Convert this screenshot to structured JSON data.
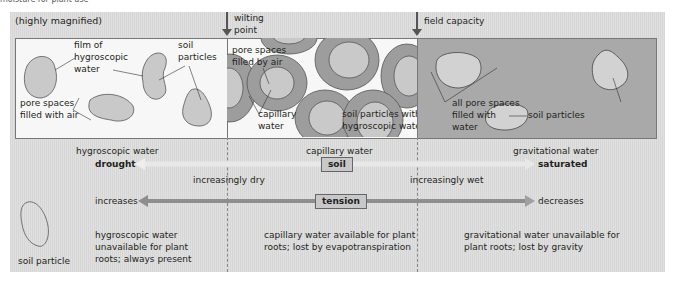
{
  "figure": {
    "caption_partial": "moisture for plant use",
    "magnification_note": "(highly magnified)"
  },
  "markers": [
    {
      "id": "wilting-point",
      "label_line1": "wilting",
      "label_line2": "point"
    },
    {
      "id": "field-capacity",
      "label": "field capacity"
    }
  ],
  "panels": {
    "hygroscopic": {
      "labels": {
        "film": [
          "film of",
          "hygroscopic",
          "water"
        ],
        "soil_particles": [
          "soil",
          "particles"
        ],
        "pore_spaces": [
          "pore spaces",
          "filled with air"
        ]
      }
    },
    "capillary": {
      "labels": {
        "pore_spaces": [
          "pore spaces",
          "filled by air"
        ],
        "capillary_water": [
          "capillary",
          "water"
        ],
        "soil_particles": [
          "soil particles with",
          "hygroscopic water"
        ]
      }
    },
    "gravitational": {
      "labels": {
        "pore_spaces": [
          "all pore  spaces",
          "filled with",
          "water"
        ],
        "soil_particles": "soil particles"
      }
    }
  },
  "scale": {
    "water_types": [
      "hygroscopic water",
      "capillary water",
      "gravitational water"
    ],
    "soil_axis": {
      "label": "soil",
      "left": "drought",
      "right": "saturated",
      "left_trend": "increasingly dry",
      "right_trend": "increasingly wet"
    },
    "tension_axis": {
      "label": "tension",
      "left": "increases",
      "right": "decreases"
    }
  },
  "descriptions": {
    "hygroscopic": [
      "hygroscopic water",
      "unavailable for plant",
      "roots; always present"
    ],
    "capillary": [
      "capillary water available for plant",
      "roots; lost by evapotranspiration"
    ],
    "gravitational": [
      "gravitational water unavailable for",
      "plant roots; lost by gravity"
    ]
  },
  "legend": {
    "soil_particle": "soil particle"
  },
  "colors": {
    "background": "#dcdcdc",
    "white_panel": "#f7f7f7",
    "saturated_panel": "#a9a9a9",
    "particle_fill": "#c9c9c9",
    "water_film": "#9d9d9d",
    "soil_arrow": "#e8e8e8",
    "tension_arrow": "#8e8e8e"
  }
}
